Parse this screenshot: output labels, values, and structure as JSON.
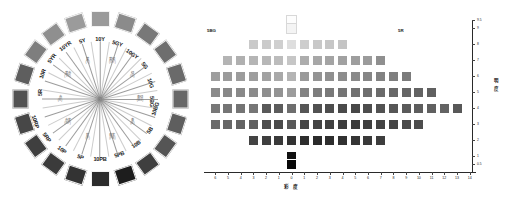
{
  "figure": {
    "title_left": "Munsell Hue Circle",
    "title_right": "Munsell Constant-Hue Value / Chroma Chart"
  },
  "hue_circle": {
    "name": "hue-circle",
    "hub_name": "hue-circle-center",
    "hues": [
      {
        "label": "5R",
        "angle": 180,
        "swatch": "#525252"
      },
      {
        "label": "10R",
        "angle": 198,
        "swatch": "#5e5e5e"
      },
      {
        "label": "5YR",
        "angle": 216,
        "swatch": "#7e7e7e"
      },
      {
        "label": "10YR",
        "angle": 234,
        "swatch": "#8f8f8f"
      },
      {
        "label": "5Y",
        "angle": 252,
        "swatch": "#9b9b9b"
      },
      {
        "label": "10Y",
        "angle": 270,
        "swatch": "#9a9a9a"
      },
      {
        "label": "5GY",
        "angle": 288,
        "swatch": "#8b8b8b"
      },
      {
        "label": "10GY",
        "angle": 306,
        "swatch": "#787878"
      },
      {
        "label": "5G",
        "angle": 324,
        "swatch": "#6e6e6e"
      },
      {
        "label": "10G",
        "angle": 342,
        "swatch": "#6a6a6a"
      },
      {
        "label": "5BG",
        "angle": 0,
        "swatch": "#686868"
      },
      {
        "label": "10BG",
        "angle": 18,
        "swatch": "#5e5e5e"
      },
      {
        "label": "5B",
        "angle": 36,
        "swatch": "#555555"
      },
      {
        "label": "10B",
        "angle": 54,
        "swatch": "#3f3f3f"
      },
      {
        "label": "5PB",
        "angle": 72,
        "swatch": "#1d1d1d"
      },
      {
        "label": "10PB",
        "angle": 90,
        "swatch": "#2c2c2c"
      },
      {
        "label": "5P",
        "angle": 108,
        "swatch": "#333333"
      },
      {
        "label": "10P",
        "angle": 126,
        "swatch": "#3b3b3b"
      },
      {
        "label": "5RP",
        "angle": 144,
        "swatch": "#3f3f3f"
      },
      {
        "label": "10RP",
        "angle": 162,
        "swatch": "#474747"
      }
    ],
    "inner_labels": [
      {
        "line1": "赤",
        "line2": "(R)",
        "angle": 180
      },
      {
        "line1": "黄赤",
        "line2": "(YR)",
        "angle": 216
      },
      {
        "line1": "黄",
        "line2": "(Y)",
        "angle": 252
      },
      {
        "line1": "黄緑",
        "line2": "(GY)",
        "angle": 288
      },
      {
        "line1": "緑",
        "line2": "(G)",
        "angle": 324
      },
      {
        "line1": "青緑",
        "line2": "(BG)",
        "angle": 0
      },
      {
        "line1": "青",
        "line2": "(B)",
        "angle": 36
      },
      {
        "line1": "青紫",
        "line2": "(PB)",
        "angle": 72
      },
      {
        "line1": "紫",
        "line2": "(P)",
        "angle": 108
      },
      {
        "line1": "赤紫",
        "line2": "(RP)",
        "angle": 144
      }
    ]
  },
  "chart_data": {
    "type": "heatmap",
    "title": "",
    "xlabel": "彩 度",
    "ylabel": "明 度",
    "left_hue": "5BG",
    "right_hue": "5R",
    "xtick_labels": [
      "6",
      "5",
      "4",
      "3",
      "2",
      "1",
      "0",
      "1",
      "2",
      "3",
      "4",
      "5",
      "6",
      "7",
      "8",
      "9",
      "10",
      "11",
      "12",
      "13",
      "14"
    ],
    "xtick_values": [
      -6,
      -5,
      -4,
      -3,
      -2,
      -1,
      0,
      1,
      2,
      3,
      4,
      5,
      6,
      7,
      8,
      9,
      10,
      11,
      12,
      13,
      14
    ],
    "ytick_labels": [
      "9.5",
      "9",
      "8",
      "7",
      "6",
      "5",
      "4",
      "3",
      "2",
      "1",
      "0.5"
    ],
    "ytick_values": [
      9.5,
      9,
      8,
      7,
      6,
      5,
      4,
      3,
      2,
      1,
      0.5
    ],
    "xlim": [
      -6.8,
      14.8
    ],
    "ylim": [
      0.2,
      9.9
    ],
    "grid": false,
    "legend": "none",
    "cells": [
      {
        "x": 0,
        "y": 9.5,
        "color": "#fdfdfd",
        "outline": true
      },
      {
        "x": 0,
        "y": 9,
        "color": "#f4f4f4",
        "outline": true
      },
      {
        "x": -3,
        "y": 8,
        "color": "#c9c9c9"
      },
      {
        "x": -2,
        "y": 8,
        "color": "#cbcbcb"
      },
      {
        "x": -1,
        "y": 8,
        "color": "#cfcfcf"
      },
      {
        "x": 0,
        "y": 8,
        "color": "#dedede"
      },
      {
        "x": 1,
        "y": 8,
        "color": "#cdcdcd"
      },
      {
        "x": 2,
        "y": 8,
        "color": "#c8c8c8"
      },
      {
        "x": 3,
        "y": 8,
        "color": "#c6c6c6"
      },
      {
        "x": 4,
        "y": 8,
        "color": "#c4c4c4"
      },
      {
        "x": -5,
        "y": 7,
        "color": "#b4b4b4"
      },
      {
        "x": -4,
        "y": 7,
        "color": "#b0b0b0"
      },
      {
        "x": -3,
        "y": 7,
        "color": "#b5b5b5"
      },
      {
        "x": -2,
        "y": 7,
        "color": "#b7b7b7"
      },
      {
        "x": -1,
        "y": 7,
        "color": "#bcbcbc"
      },
      {
        "x": 0,
        "y": 7,
        "color": "#c6c6c6"
      },
      {
        "x": 1,
        "y": 7,
        "color": "#adadad"
      },
      {
        "x": 2,
        "y": 7,
        "color": "#a7a7a7"
      },
      {
        "x": 3,
        "y": 7,
        "color": "#a4a4a4"
      },
      {
        "x": 4,
        "y": 7,
        "color": "#a1a1a1"
      },
      {
        "x": 5,
        "y": 7,
        "color": "#9e9e9e"
      },
      {
        "x": 6,
        "y": 7,
        "color": "#9b9b9b"
      },
      {
        "x": 7,
        "y": 7,
        "color": "#8f8f8f"
      },
      {
        "x": -6,
        "y": 6,
        "color": "#9e9e9e"
      },
      {
        "x": -5,
        "y": 6,
        "color": "#9b9b9b"
      },
      {
        "x": -4,
        "y": 6,
        "color": "#9c9c9c"
      },
      {
        "x": -3,
        "y": 6,
        "color": "#9e9e9e"
      },
      {
        "x": -2,
        "y": 6,
        "color": "#a2a2a2"
      },
      {
        "x": -1,
        "y": 6,
        "color": "#a9a9a9"
      },
      {
        "x": 0,
        "y": 6,
        "color": "#b4b4b4"
      },
      {
        "x": 1,
        "y": 6,
        "color": "#9a9a9a"
      },
      {
        "x": 2,
        "y": 6,
        "color": "#949494"
      },
      {
        "x": 3,
        "y": 6,
        "color": "#909090"
      },
      {
        "x": 4,
        "y": 6,
        "color": "#8d8d8d"
      },
      {
        "x": 5,
        "y": 6,
        "color": "#8a8a8a"
      },
      {
        "x": 6,
        "y": 6,
        "color": "#868686"
      },
      {
        "x": 7,
        "y": 6,
        "color": "#828282"
      },
      {
        "x": 8,
        "y": 6,
        "color": "#7f7f7f"
      },
      {
        "x": 9,
        "y": 6,
        "color": "#7b7b7b"
      },
      {
        "x": -6,
        "y": 5,
        "color": "#8b8b8b"
      },
      {
        "x": -5,
        "y": 5,
        "color": "#888888"
      },
      {
        "x": -4,
        "y": 5,
        "color": "#898989"
      },
      {
        "x": -3,
        "y": 5,
        "color": "#8b8b8b"
      },
      {
        "x": -2,
        "y": 5,
        "color": "#8e8e8e"
      },
      {
        "x": -1,
        "y": 5,
        "color": "#939393"
      },
      {
        "x": 0,
        "y": 5,
        "color": "#9c9c9c"
      },
      {
        "x": 1,
        "y": 5,
        "color": "#838383"
      },
      {
        "x": 2,
        "y": 5,
        "color": "#7d7d7d"
      },
      {
        "x": 3,
        "y": 5,
        "color": "#797979"
      },
      {
        "x": 4,
        "y": 5,
        "color": "#757575"
      },
      {
        "x": 5,
        "y": 5,
        "color": "#717171"
      },
      {
        "x": 6,
        "y": 5,
        "color": "#6e6e6e"
      },
      {
        "x": 7,
        "y": 5,
        "color": "#6b6b6b"
      },
      {
        "x": 8,
        "y": 5,
        "color": "#686868"
      },
      {
        "x": 9,
        "y": 5,
        "color": "#656565"
      },
      {
        "x": 10,
        "y": 5,
        "color": "#636363"
      },
      {
        "x": 11,
        "y": 5,
        "color": "#606060"
      },
      {
        "x": -6,
        "y": 4,
        "color": "#787878"
      },
      {
        "x": -5,
        "y": 4,
        "color": "#757575"
      },
      {
        "x": -4,
        "y": 4,
        "color": "#747474"
      },
      {
        "x": -3,
        "y": 4,
        "color": "#767676"
      },
      {
        "x": -2,
        "y": 4,
        "color": "#595959"
      },
      {
        "x": -1,
        "y": 4,
        "color": "#5c5c5c"
      },
      {
        "x": 0,
        "y": 4,
        "color": "#6e6e6e"
      },
      {
        "x": 1,
        "y": 4,
        "color": "#565656"
      },
      {
        "x": 2,
        "y": 4,
        "color": "#515151"
      },
      {
        "x": 3,
        "y": 4,
        "color": "#4d4d4d"
      },
      {
        "x": 4,
        "y": 4,
        "color": "#4a4a4a"
      },
      {
        "x": 5,
        "y": 4,
        "color": "#484848"
      },
      {
        "x": 6,
        "y": 4,
        "color": "#4d4d4d"
      },
      {
        "x": 7,
        "y": 4,
        "color": "#525252"
      },
      {
        "x": 8,
        "y": 4,
        "color": "#565656"
      },
      {
        "x": 9,
        "y": 4,
        "color": "#5a5a5a"
      },
      {
        "x": 10,
        "y": 4,
        "color": "#5d5d5d"
      },
      {
        "x": 11,
        "y": 4,
        "color": "#606060"
      },
      {
        "x": 12,
        "y": 4,
        "color": "#636363"
      },
      {
        "x": 13,
        "y": 4,
        "color": "#585858"
      },
      {
        "x": -6,
        "y": 3,
        "color": "#6a6a6a"
      },
      {
        "x": -5,
        "y": 3,
        "color": "#676767"
      },
      {
        "x": -4,
        "y": 3,
        "color": "#636363"
      },
      {
        "x": -3,
        "y": 3,
        "color": "#606060"
      },
      {
        "x": -2,
        "y": 3,
        "color": "#4d4d4d"
      },
      {
        "x": -1,
        "y": 3,
        "color": "#4a4a4a"
      },
      {
        "x": 0,
        "y": 3,
        "color": "#595959"
      },
      {
        "x": 1,
        "y": 3,
        "color": "#464646"
      },
      {
        "x": 2,
        "y": 3,
        "color": "#434343"
      },
      {
        "x": 3,
        "y": 3,
        "color": "#404040"
      },
      {
        "x": 4,
        "y": 3,
        "color": "#3e3e3e"
      },
      {
        "x": 5,
        "y": 3,
        "color": "#3c3c3c"
      },
      {
        "x": 6,
        "y": 3,
        "color": "#3f3f3f"
      },
      {
        "x": 7,
        "y": 3,
        "color": "#434343"
      },
      {
        "x": 8,
        "y": 3,
        "color": "#464646"
      },
      {
        "x": 9,
        "y": 3,
        "color": "#4a4a4a"
      },
      {
        "x": 10,
        "y": 3,
        "color": "#4d4d4d"
      },
      {
        "x": -3,
        "y": 2,
        "color": "#434343"
      },
      {
        "x": -2,
        "y": 2,
        "color": "#3e3e3e"
      },
      {
        "x": -1,
        "y": 2,
        "color": "#3a3a3a"
      },
      {
        "x": 0,
        "y": 2,
        "color": "#333333"
      },
      {
        "x": 1,
        "y": 2,
        "color": "#2d2d2d"
      },
      {
        "x": 2,
        "y": 2,
        "color": "#2b2b2b"
      },
      {
        "x": 3,
        "y": 2,
        "color": "#2e2e2e"
      },
      {
        "x": 4,
        "y": 2,
        "color": "#313131"
      },
      {
        "x": 5,
        "y": 2,
        "color": "#353535"
      },
      {
        "x": 6,
        "y": 2,
        "color": "#393939"
      },
      {
        "x": 7,
        "y": 2,
        "color": "#3d3d3d"
      },
      {
        "x": 0,
        "y": 1,
        "color": "#111111"
      },
      {
        "x": 0,
        "y": 0.5,
        "color": "#080808"
      }
    ]
  }
}
